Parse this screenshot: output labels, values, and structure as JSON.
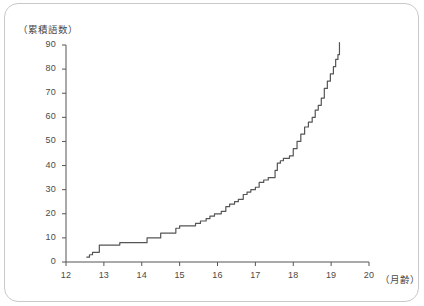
{
  "chart_data": {
    "type": "line",
    "title": "",
    "subtitle": "",
    "xlabel": "（月齢）",
    "ylabel": "（累積語数）",
    "xlim": [
      12,
      20
    ],
    "ylim": [
      0,
      90
    ],
    "x_ticks": [
      12,
      13,
      14,
      15,
      16,
      17,
      18,
      19,
      20
    ],
    "x_tick_labels": [
      "12",
      "13",
      "14",
      "15",
      "16",
      "17",
      "18",
      "19",
      "20"
    ],
    "y_ticks": [
      0,
      10,
      20,
      30,
      40,
      50,
      60,
      70,
      80,
      90
    ],
    "y_tick_labels": [
      "0",
      "10",
      "20",
      "30",
      "40",
      "50",
      "60",
      "70",
      "80",
      "90"
    ],
    "grid": false,
    "legend": null,
    "legend_position": "none",
    "line_color": "#555555",
    "line_width": 1.2,
    "step_style": "staircase",
    "annotations": [],
    "series": [
      {
        "name": "累積語数",
        "x": [
          12.55,
          12.62,
          12.7,
          12.78,
          12.86,
          12.88,
          12.95,
          13.05,
          13.2,
          13.38,
          13.42,
          13.6,
          13.8,
          14.0,
          14.1,
          14.14,
          14.3,
          14.45,
          14.5,
          14.62,
          14.78,
          14.9,
          15.0,
          15.18,
          15.3,
          15.42,
          15.55,
          15.7,
          15.8,
          15.92,
          16.0,
          16.1,
          16.22,
          16.32,
          16.45,
          16.55,
          16.68,
          16.78,
          16.88,
          17.0,
          17.1,
          17.22,
          17.34,
          17.46,
          17.52,
          17.58,
          17.66,
          17.74,
          17.82,
          17.9,
          18.0,
          18.1,
          18.2,
          18.3,
          18.4,
          18.5,
          18.58,
          18.66,
          18.74,
          18.82,
          18.9,
          18.98,
          19.06,
          19.12,
          19.18,
          19.22
        ],
        "y": [
          2,
          3,
          4,
          4,
          4,
          7,
          7,
          7,
          7,
          7,
          8,
          8,
          8,
          8,
          8,
          10,
          10,
          10,
          12,
          12,
          12,
          14,
          15,
          15,
          15,
          16,
          17,
          18,
          19,
          20,
          20,
          21,
          23,
          24,
          25,
          26,
          28,
          29,
          30,
          31,
          33,
          34,
          35,
          35,
          38,
          41,
          42,
          43,
          43,
          44,
          47,
          50,
          53,
          56,
          58,
          60,
          63,
          65,
          68,
          72,
          75,
          78,
          81,
          84,
          86,
          91
        ]
      }
    ]
  },
  "axes_geometry": {
    "x_pixel_min": 66,
    "x_pixel_max": 369,
    "y_pixel_min": 262,
    "y_pixel_max": 45
  }
}
